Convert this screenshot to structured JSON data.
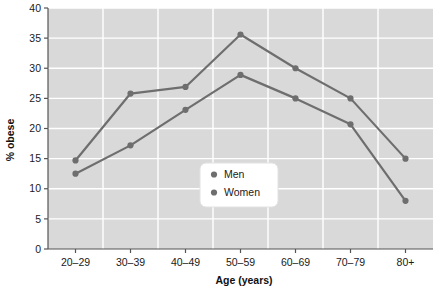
{
  "chart_data": {
    "type": "line",
    "title": "",
    "subtitle": "",
    "xlabel": "Age (years)",
    "ylabel": "% obese",
    "categories": [
      "20–29",
      "30–39",
      "40–49",
      "50–59",
      "60–69",
      "70–79",
      "80+"
    ],
    "series": [
      {
        "name": "Men",
        "values": [
          14.7,
          25.8,
          26.9,
          35.6,
          30.0,
          25.0,
          15.0
        ]
      },
      {
        "name": "Women",
        "values": [
          12.5,
          17.2,
          23.1,
          28.9,
          25.0,
          20.7,
          8.0
        ]
      }
    ],
    "ylim": [
      0,
      40
    ],
    "yticks": [
      0,
      5,
      10,
      15,
      20,
      25,
      30,
      35,
      40
    ],
    "ytick_labels": [
      "0",
      "5",
      "10",
      "15",
      "20",
      "25",
      "30",
      "35",
      "40"
    ],
    "grid": true,
    "grid_color": "#ffffff",
    "plot_background": "#d9d9d9",
    "figure_background": "#ffffff",
    "legend_position": "center",
    "legend_entries": [
      "Men",
      "Women"
    ],
    "series_color": "#6e6e6e",
    "marker_color": "#6e6e6e",
    "marker_shape": "circle"
  },
  "legend": {
    "items": [
      {
        "label": "Men"
      },
      {
        "label": "Women"
      }
    ]
  },
  "axes": {
    "y_title": "% obese",
    "x_title": "Age (years)"
  }
}
